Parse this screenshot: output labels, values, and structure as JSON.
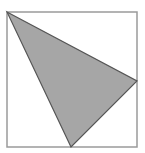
{
  "diagram": {
    "type": "geometry",
    "square": {
      "x": 7,
      "y": 12,
      "width": 130,
      "height": 135,
      "stroke": "#9a9a9a",
      "fill": "#ffffff"
    },
    "triangle": {
      "points": [
        [
          7,
          12
        ],
        [
          137,
          81
        ],
        [
          71,
          147
        ]
      ],
      "fill": "#a6a6a6",
      "stroke": "#555555"
    }
  }
}
